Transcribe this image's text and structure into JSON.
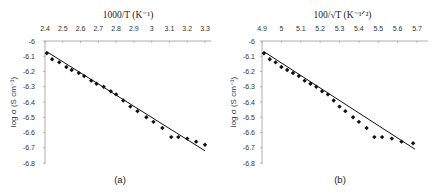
{
  "chart_data": [
    {
      "type": "scatter",
      "panel_label": "(a)",
      "title": "",
      "xlabel": "1000/T (K⁻¹)",
      "ylabel": "log σ (S cm⁻¹)",
      "xlim": [
        2.4,
        3.3
      ],
      "ylim": [
        -6.8,
        -6.0
      ],
      "x_axis_position": "top",
      "xticks": [
        "2.4",
        "2.5",
        "2.6",
        "2.7",
        "2.8",
        "2.9",
        "3",
        "3.1",
        "3.2",
        "3.3"
      ],
      "yticks": [
        "-6",
        "-6.1",
        "-6.2",
        "-6.3",
        "-6.4",
        "-6.5",
        "-6.6",
        "-6.7",
        "-6.8"
      ],
      "grid": false,
      "series": [
        {
          "name": "data",
          "marker": "diamond",
          "x": [
            2.41,
            2.44,
            2.48,
            2.52,
            2.55,
            2.59,
            2.62,
            2.66,
            2.69,
            2.73,
            2.77,
            2.8,
            2.84,
            2.88,
            2.92,
            2.97,
            3.01,
            3.06,
            3.11,
            3.15,
            3.2,
            3.25,
            3.3
          ],
          "y": [
            -6.08,
            -6.12,
            -6.14,
            -6.17,
            -6.19,
            -6.21,
            -6.23,
            -6.26,
            -6.28,
            -6.3,
            -6.33,
            -6.35,
            -6.39,
            -6.43,
            -6.46,
            -6.5,
            -6.53,
            -6.57,
            -6.63,
            -6.63,
            -6.64,
            -6.66,
            -6.68
          ]
        },
        {
          "name": "linear fit",
          "type": "line",
          "x": [
            2.41,
            3.3
          ],
          "y": [
            -6.07,
            -6.72
          ]
        }
      ]
    },
    {
      "type": "scatter",
      "panel_label": "(b)",
      "title": "",
      "xlabel": "100/√T (K⁻¹ᐟ²)",
      "ylabel": "log σ (S cm⁻¹)",
      "xlim": [
        4.9,
        5.7
      ],
      "ylim": [
        -6.8,
        -6.0
      ],
      "x_axis_position": "top",
      "xticks": [
        "4.9",
        "5",
        "5.1",
        "5.2",
        "5.3",
        "5.4",
        "5.5",
        "5.6",
        "5.7"
      ],
      "yticks": [
        "-6",
        "-6.1",
        "-6.2",
        "-6.3",
        "-6.4",
        "-6.5",
        "-6.6",
        "-6.7",
        "-6.8"
      ],
      "grid": false,
      "series": [
        {
          "name": "data",
          "marker": "diamond",
          "x": [
            4.91,
            4.94,
            4.97,
            5.0,
            5.03,
            5.06,
            5.09,
            5.12,
            5.15,
            5.18,
            5.21,
            5.24,
            5.27,
            5.3,
            5.33,
            5.37,
            5.4,
            5.44,
            5.48,
            5.52,
            5.57,
            5.62,
            5.68
          ],
          "y": [
            -6.08,
            -6.12,
            -6.14,
            -6.17,
            -6.19,
            -6.21,
            -6.23,
            -6.26,
            -6.28,
            -6.3,
            -6.33,
            -6.35,
            -6.39,
            -6.43,
            -6.46,
            -6.5,
            -6.53,
            -6.57,
            -6.63,
            -6.63,
            -6.64,
            -6.66,
            -6.67
          ]
        },
        {
          "name": "linear fit",
          "type": "line",
          "x": [
            4.91,
            5.69
          ],
          "y": [
            -6.07,
            -6.71
          ]
        }
      ]
    }
  ]
}
